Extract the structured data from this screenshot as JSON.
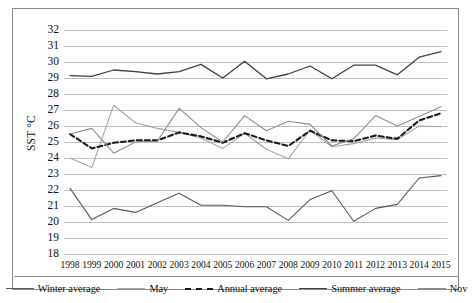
{
  "chart_data": {
    "type": "line",
    "title": "",
    "xlabel": "",
    "ylabel": "SST °C",
    "ylim": [
      18,
      32
    ],
    "ystep": 1,
    "grid": true,
    "legend_position": "bottom",
    "categories": [
      1998,
      1999,
      2000,
      2001,
      2002,
      2003,
      2004,
      2005,
      2006,
      2007,
      2008,
      2009,
      2010,
      2011,
      2012,
      2013,
      2014,
      2015
    ],
    "ytick_labels": [
      "32",
      "31",
      "30",
      "29",
      "28",
      "27",
      "26",
      "25",
      "24",
      "23",
      "22",
      "21",
      "20",
      "19",
      "18"
    ],
    "xtick_labels": [
      "1998",
      "1999",
      "2000",
      "2001",
      "2002",
      "2003",
      "2004",
      "2005",
      "2006",
      "2007",
      "2008",
      "2009",
      "2010",
      "2011",
      "2012",
      "2013",
      "2014",
      "2015"
    ],
    "series": [
      {
        "name": "Winter average",
        "color": "#595959",
        "width": 1.1,
        "dash": "none",
        "values": [
          22.1,
          20.15,
          20.85,
          20.6,
          21.2,
          21.8,
          21.05,
          21.05,
          20.95,
          20.95,
          20.1,
          21.4,
          21.95,
          20.05,
          20.85,
          21.1,
          22.75,
          22.9
        ]
      },
      {
        "name": "May",
        "color": "#a6a6a6",
        "width": 1.1,
        "dash": "none",
        "values": [
          24.0,
          23.4,
          27.3,
          26.2,
          25.85,
          25.6,
          25.25,
          24.6,
          25.55,
          24.55,
          23.95,
          25.75,
          24.7,
          24.9,
          25.25,
          25.15,
          26.0,
          25.95
        ]
      },
      {
        "name": "Annual average",
        "color": "#1a1a1a",
        "width": 2.1,
        "dash": "5,3",
        "values": [
          25.5,
          24.6,
          24.95,
          25.1,
          25.1,
          25.6,
          25.35,
          24.95,
          25.55,
          25.1,
          24.75,
          25.7,
          25.1,
          25.05,
          25.4,
          25.2,
          26.35,
          26.8
        ]
      },
      {
        "name": "Summer average",
        "color": "#404040",
        "width": 1.3,
        "dash": "none",
        "values": [
          29.15,
          29.1,
          29.5,
          29.4,
          29.25,
          29.4,
          29.85,
          29.0,
          30.05,
          28.95,
          29.25,
          29.75,
          28.95,
          29.8,
          29.8,
          29.2,
          30.3,
          30.65
        ]
      },
      {
        "name": "Nov",
        "color": "#8c8c8c",
        "width": 1.1,
        "dash": "none",
        "values": [
          25.5,
          25.85,
          24.3,
          25.0,
          25.05,
          27.1,
          25.9,
          25.0,
          26.65,
          25.7,
          26.3,
          26.1,
          24.75,
          25.2,
          26.65,
          26.0,
          26.6,
          27.2
        ]
      }
    ]
  },
  "legend": {
    "items": [
      {
        "label": "Winter average",
        "color": "#595959",
        "dash": "none",
        "width": 1.1
      },
      {
        "label": "May",
        "color": "#a6a6a6",
        "dash": "none",
        "width": 1.1
      },
      {
        "label": "Annual average",
        "color": "#1a1a1a",
        "dash": "dashed",
        "width": 2.2
      },
      {
        "label": "Summer average",
        "color": "#404040",
        "dash": "none",
        "width": 1.3
      },
      {
        "label": "Nov",
        "color": "#8c8c8c",
        "dash": "none",
        "width": 1.1
      }
    ]
  }
}
